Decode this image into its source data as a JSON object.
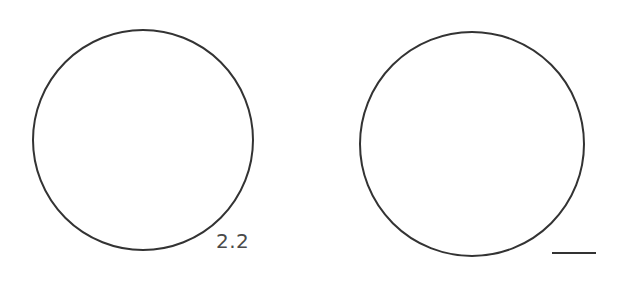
{
  "figure": {
    "label": "2.2",
    "stroke_color": "#333333",
    "label_color": "#4a4a4a",
    "background": "#ffffff",
    "circles": [
      {
        "name": "left-circle",
        "cx": 143,
        "cy": 140,
        "r": 110
      },
      {
        "name": "right-circle",
        "cx": 472,
        "cy": 144,
        "r": 112
      }
    ],
    "scale_bar": {
      "x1": 552,
      "x2": 596,
      "y": 253
    }
  }
}
